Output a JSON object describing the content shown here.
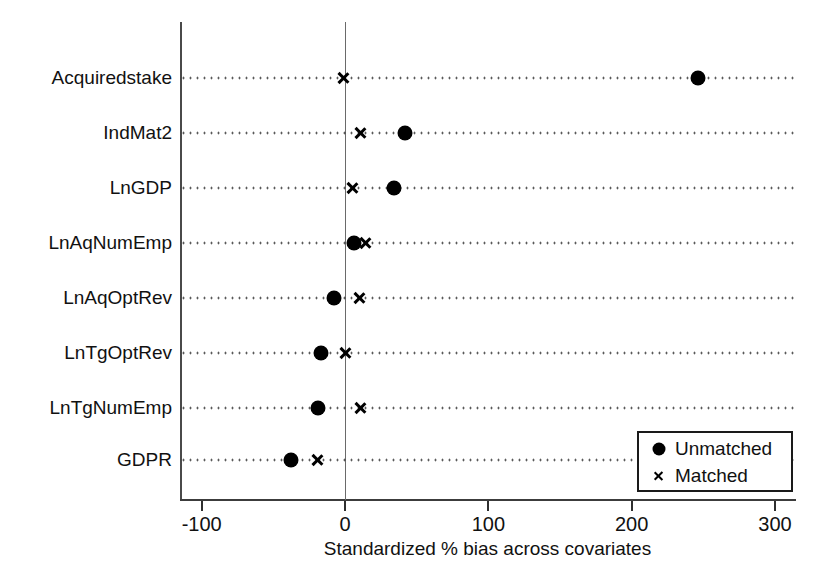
{
  "chart_data": {
    "type": "scatter",
    "title": "",
    "subtitle": "",
    "xlabel": "Standardized % bias across covariates",
    "ylabel": "",
    "xlim": [
      -134,
      290
    ],
    "xticks": [
      -100,
      0,
      100,
      200,
      300
    ],
    "xtick_labels": [
      "-100",
      "0",
      "100",
      "200",
      "300"
    ],
    "grid": "dotted horizontal guide lines per category",
    "legend_position": "bottom-right",
    "zero_reference_line": 0,
    "categories": [
      "Acquiredstake",
      "IndMat2",
      "LnGDP",
      "LnAqNumEmp",
      "LnAqOptRev",
      "LnTgOptRev",
      "LnTgNumEmp",
      "GDPR"
    ],
    "series": [
      {
        "name": "Unmatched",
        "marker": "filled-circle",
        "values": [
          246,
          42,
          34,
          6,
          -8,
          -17,
          -19,
          -38
        ]
      },
      {
        "name": "Matched",
        "marker": "x-cross",
        "values": [
          -1,
          11,
          5,
          14,
          10,
          0,
          11,
          -19
        ]
      }
    ]
  },
  "legend": {
    "entries": [
      {
        "label": "Unmatched",
        "marker": "filled-circle"
      },
      {
        "label": "Matched",
        "marker": "x-cross"
      }
    ]
  },
  "axis": {
    "x_title": "Standardized % bias across covariates"
  },
  "colors": {
    "marker": "#000000",
    "axis": "#3c3c3c",
    "guide": "#222222",
    "background": "#ffffff"
  }
}
